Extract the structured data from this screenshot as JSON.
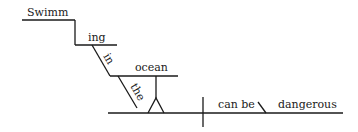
{
  "diagram": {
    "type": "sentence-diagram",
    "sentence": "Swimming in the ocean can be dangerous",
    "words": {
      "gerund_stem": "Swimm",
      "gerund_suffix": "ing",
      "preposition": "in",
      "article": "the",
      "object": "ocean",
      "verb": "can be",
      "predicate_adjective": "dangerous"
    },
    "colors": {
      "ink": "#1a1a1a",
      "background": "#ffffff"
    }
  }
}
